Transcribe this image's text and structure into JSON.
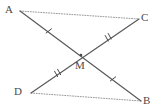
{
  "figure": {
    "title": "",
    "type": "geometry-diagram",
    "width": 157,
    "height": 111,
    "background_color": "#ffffff"
  },
  "points": [
    {
      "id": "A",
      "label": "A",
      "x": 20,
      "y": 11,
      "label_x": 5,
      "label_y": 4
    },
    {
      "id": "C",
      "label": "C",
      "x": 139,
      "y": 19,
      "label_x": 141,
      "label_y": 12
    },
    {
      "id": "D",
      "label": "D",
      "x": 31,
      "y": 93,
      "label_x": 14,
      "label_y": 86
    },
    {
      "id": "B",
      "label": "B",
      "x": 141,
      "y": 101,
      "label_x": 143,
      "label_y": 95
    },
    {
      "id": "M",
      "label": "M",
      "x": 81,
      "y": 55,
      "label_x": 75,
      "label_y": 60
    }
  ],
  "segments": [
    {
      "id": "AB",
      "from": "A",
      "to": "B",
      "style": "solid",
      "color": "#5a5a5a",
      "width": 1.2
    },
    {
      "id": "DC",
      "from": "D",
      "to": "C",
      "style": "solid",
      "color": "#5a5a5a",
      "width": 1.2
    },
    {
      "id": "AC",
      "from": "A",
      "to": "C",
      "style": "dotted",
      "color": "#9a9a9a",
      "width": 1.0
    },
    {
      "id": "DB",
      "from": "D",
      "to": "B",
      "style": "dotted",
      "color": "#9a9a9a",
      "width": 1.0
    }
  ],
  "tick_marks": [
    {
      "id": "tick-AM",
      "segment": "AM",
      "count": 1,
      "x": 49,
      "y": 31,
      "angle_deg": 61
    },
    {
      "id": "tick-MB",
      "segment": "MB",
      "count": 1,
      "x": 113,
      "y": 79,
      "angle_deg": 61
    },
    {
      "id": "tick-DM",
      "segment": "DM",
      "count": 2,
      "x": 57,
      "y": 74,
      "angle_deg": -37
    },
    {
      "id": "tick-MC",
      "segment": "MC",
      "count": 2,
      "x": 108,
      "y": 38,
      "angle_deg": -37
    }
  ],
  "styles": {
    "label_color": "#4a4a4a",
    "solid_line_color": "#5a5a5a",
    "dotted_line_color": "#9a9a9a",
    "tick_color": "#4a4a4a"
  }
}
